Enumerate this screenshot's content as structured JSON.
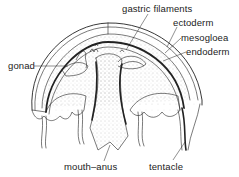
{
  "diagram": {
    "colors": {
      "ink": "#222222",
      "background": "#ffffff",
      "stipple": "#9a9a9a"
    },
    "labels": {
      "gastric_filaments": "gastric filaments",
      "ectoderm": "ectoderm",
      "mesogloea": "mesogloea",
      "endoderm": "endoderm",
      "gonad": "gonad",
      "mouth_anus": "mouth–anus",
      "tentacle": "tentacle"
    }
  }
}
